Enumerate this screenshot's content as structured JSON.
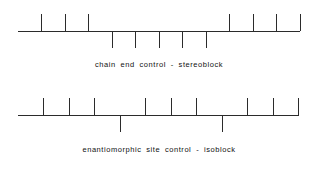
{
  "page": {
    "background_color": "#ffffff",
    "line_color": "#2b2b2b",
    "text_color": "#111111"
  },
  "figures": [
    {
      "id": "stereoblock",
      "caption": "chain end control - stereoblock",
      "units": 12,
      "pattern": [
        "up",
        "up",
        "up",
        "down",
        "down",
        "down",
        "down",
        "down",
        "up",
        "up",
        "up",
        "up"
      ]
    },
    {
      "id": "isoblock",
      "caption": "enantiomorphic site control - isoblock",
      "units": 11,
      "pattern": [
        "up",
        "up",
        "up",
        "down",
        "up",
        "up",
        "up",
        "down",
        "up",
        "up",
        "up"
      ]
    }
  ],
  "chart_data": {
    "type": "line",
    "xlabel": "",
    "ylabel": "",
    "series": [
      {
        "name": "chain end control - stereoblock",
        "categories": [
          1,
          2,
          3,
          4,
          5,
          6,
          7,
          8,
          9,
          10,
          11,
          12
        ],
        "values": [
          1,
          1,
          1,
          -1,
          -1,
          -1,
          -1,
          -1,
          1,
          1,
          1,
          1
        ],
        "annotation": "one long stereoblock inversion in the middle"
      },
      {
        "name": "enantiomorphic site control - isoblock",
        "categories": [
          1,
          2,
          3,
          4,
          5,
          6,
          7,
          8,
          9,
          10,
          11
        ],
        "values": [
          1,
          1,
          1,
          -1,
          1,
          1,
          1,
          -1,
          1,
          1,
          1
        ],
        "annotation": "isolated single-unit inversions (isoblocks)"
      }
    ],
    "legend": "none",
    "grid": false,
    "ylim": [
      -1,
      1
    ]
  }
}
